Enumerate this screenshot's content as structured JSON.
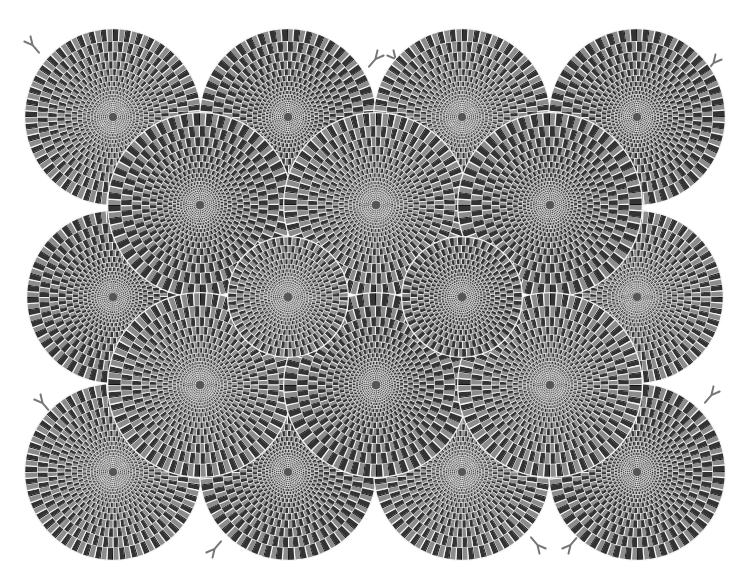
{
  "colors": {
    "background": "#ffffff",
    "dark": "#333333",
    "black": "#111111",
    "gray": "#8c8c8c",
    "white": "#f4f4f4",
    "tongue": "#777777"
  },
  "discs": [
    {
      "cx": 113,
      "cy": 117,
      "r": 88,
      "dir": 1
    },
    {
      "cx": 288,
      "cy": 117,
      "r": 88,
      "dir": -1
    },
    {
      "cx": 462,
      "cy": 117,
      "r": 88,
      "dir": 1
    },
    {
      "cx": 637,
      "cy": 117,
      "r": 88,
      "dir": -1
    },
    {
      "cx": 113,
      "cy": 297,
      "r": 86,
      "dir": -1
    },
    {
      "cx": 637,
      "cy": 297,
      "r": 86,
      "dir": 1
    },
    {
      "cx": 113,
      "cy": 472,
      "r": 88,
      "dir": 1
    },
    {
      "cx": 288,
      "cy": 472,
      "r": 88,
      "dir": -1
    },
    {
      "cx": 462,
      "cy": 472,
      "r": 88,
      "dir": 1
    },
    {
      "cx": 637,
      "cy": 472,
      "r": 88,
      "dir": -1
    },
    {
      "cx": 200,
      "cy": 205,
      "r": 92,
      "dir": -1
    },
    {
      "cx": 376,
      "cy": 205,
      "r": 92,
      "dir": 1
    },
    {
      "cx": 550,
      "cy": 205,
      "r": 92,
      "dir": -1
    },
    {
      "cx": 200,
      "cy": 385,
      "r": 92,
      "dir": 1
    },
    {
      "cx": 376,
      "cy": 385,
      "r": 92,
      "dir": -1
    },
    {
      "cx": 550,
      "cy": 385,
      "r": 92,
      "dir": 1
    },
    {
      "cx": 288,
      "cy": 297,
      "r": 60,
      "dir": 1
    },
    {
      "cx": 462,
      "cy": 297,
      "r": 60,
      "dir": -1
    }
  ],
  "tongues": [
    {
      "x": 30,
      "y": 42,
      "angle": -40
    },
    {
      "x": 378,
      "y": 56,
      "angle": 40
    },
    {
      "x": 393,
      "y": 56,
      "angle": -40
    },
    {
      "x": 716,
      "y": 60,
      "angle": 40
    },
    {
      "x": 40,
      "y": 400,
      "angle": -40
    },
    {
      "x": 714,
      "y": 392,
      "angle": 40
    },
    {
      "x": 38,
      "y": 462,
      "angle": -40
    },
    {
      "x": 212,
      "y": 552,
      "angle": -140
    },
    {
      "x": 540,
      "y": 548,
      "angle": 140
    },
    {
      "x": 568,
      "y": 548,
      "angle": -140
    }
  ]
}
